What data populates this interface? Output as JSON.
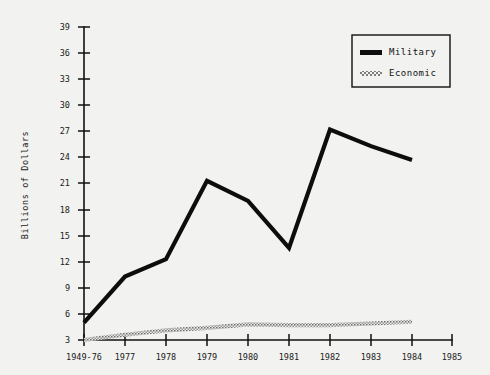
{
  "chart_data": {
    "type": "line",
    "title": "",
    "xlabel": "",
    "ylabel": "Billions of Dollars",
    "categories": [
      "1949-76",
      "1977",
      "1978",
      "1979",
      "1980",
      "1981",
      "1982",
      "1983",
      "1984",
      "1985"
    ],
    "xtick_labels": [
      "1949-76",
      "1977",
      "1978",
      "1979",
      "1980",
      "1981",
      "1982",
      "1983",
      "1984",
      "1985"
    ],
    "ytick_labels": [
      "3",
      "6",
      "9",
      "12",
      "15",
      "18",
      "21",
      "24",
      "27",
      "30",
      "33",
      "36",
      "39"
    ],
    "ytick_values": [
      3,
      6,
      9,
      12,
      15,
      18,
      21,
      24,
      27,
      30,
      33,
      36,
      39
    ],
    "ylim": [
      3,
      39
    ],
    "grid": false,
    "legend_position": "top-right",
    "series": [
      {
        "name": "Military",
        "color": "#0d0d0d",
        "style": "solid",
        "x": [
          "1949-76",
          "1977",
          "1978",
          "1979",
          "1980",
          "1981",
          "1982",
          "1983",
          "1984"
        ],
        "values": [
          5.0,
          10.3,
          12.3,
          21.3,
          19.0,
          13.6,
          27.2,
          25.3,
          23.7
        ]
      },
      {
        "name": "Economic",
        "color": "#8c8c8c",
        "style": "stippled",
        "x": [
          "1949-76",
          "1977",
          "1978",
          "1979",
          "1980",
          "1981",
          "1982",
          "1983",
          "1984"
        ],
        "values": [
          3.0,
          3.6,
          4.1,
          4.4,
          4.8,
          4.7,
          4.7,
          4.9,
          5.1
        ]
      }
    ]
  },
  "legend": {
    "entries": [
      {
        "label": "Military",
        "swatch": "solid-black-line"
      },
      {
        "label": "Economic",
        "swatch": "stippled-gray-line"
      }
    ]
  },
  "axes": {
    "y_axis_title": "Billions of Dollars"
  }
}
